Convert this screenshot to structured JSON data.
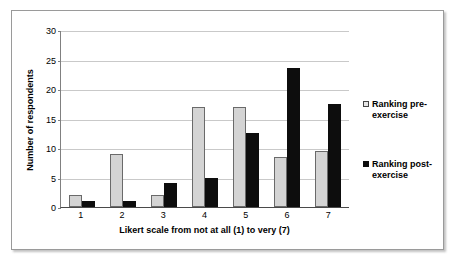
{
  "chart_data": {
    "type": "bar",
    "title": "",
    "xlabel": "Likert scale from not at all (1) to very (7)",
    "ylabel": "Number of respondents",
    "categories": [
      "1",
      "2",
      "3",
      "4",
      "5",
      "6",
      "7"
    ],
    "ylim": [
      0,
      30
    ],
    "yticks": [
      "0",
      "5",
      "10",
      "15",
      "20",
      "25",
      "30"
    ],
    "grid": "horizontal",
    "legend_position": "right",
    "series": [
      {
        "name": "Ranking pre-exercise",
        "color": "#d4d4d4",
        "values": [
          2,
          9,
          2,
          17,
          17,
          8.5,
          9.5
        ]
      },
      {
        "name": "Ranking post-exercise",
        "color": "#0d0d0d",
        "values": [
          1,
          1,
          4,
          5,
          12.5,
          23.5,
          17.5
        ]
      }
    ]
  },
  "legend": {
    "entries": [
      {
        "label_line1": "Ranking pre-",
        "label_line2": "exercise",
        "marker": "open-square-marker"
      },
      {
        "label_line1": "Ranking post-",
        "label_line2": "exercise",
        "marker": "filled-square-marker"
      }
    ]
  },
  "caption": {
    "text": ""
  }
}
